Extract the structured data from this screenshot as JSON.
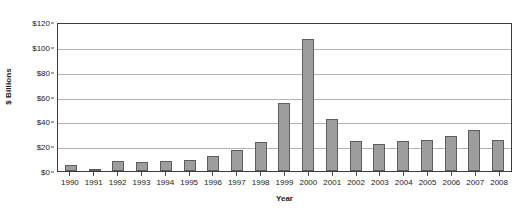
{
  "chart_data": {
    "type": "bar",
    "title": "",
    "xlabel": "Year",
    "ylabel": "$ Billions",
    "categories": [
      "1990",
      "1991",
      "1992",
      "1993",
      "1994",
      "1995",
      "1996",
      "1997",
      "1998",
      "1999",
      "2000",
      "2001",
      "2002",
      "2003",
      "2004",
      "2005",
      "2006",
      "2007",
      "2008"
    ],
    "values": [
      5,
      2,
      8,
      7,
      8,
      9,
      12,
      17,
      23,
      55,
      106,
      42,
      24,
      22,
      24,
      25,
      28,
      33,
      25
    ],
    "ylim": [
      0,
      120
    ],
    "yticks": [
      0,
      20,
      40,
      60,
      80,
      100,
      120
    ],
    "ytick_labels": [
      "$0",
      "$20",
      "$40",
      "$60",
      "$80",
      "$100",
      "$120"
    ],
    "grid": true,
    "legend": false,
    "legend_position": "none",
    "bar_color": "#9d9d9d",
    "bar_border_color": "#5d5d5d",
    "gridline_color": "#b4b4b4",
    "axis_color": "#3c3c3c"
  }
}
